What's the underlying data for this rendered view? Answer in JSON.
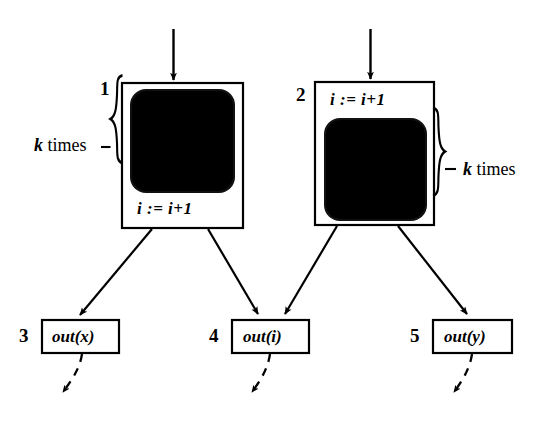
{
  "figure": {
    "type": "control-flow-diagram",
    "background": "#ffffff",
    "stroke": "#000000"
  },
  "loop_nodes": [
    {
      "id": "node-1",
      "number": "1",
      "assignment": "i := i+1",
      "assignment_position": "bottom",
      "annotation": "k times",
      "annotation_side": "left",
      "blob": "filled-black-rounded-square"
    },
    {
      "id": "node-2",
      "number": "2",
      "assignment": "i := i+1",
      "assignment_position": "top",
      "annotation": "k times",
      "annotation_side": "right",
      "blob": "filled-black-rounded-square"
    }
  ],
  "output_nodes": [
    {
      "id": "node-3",
      "number": "3",
      "label": "out(x)"
    },
    {
      "id": "node-4",
      "number": "4",
      "label": "out(i)"
    },
    {
      "id": "node-5",
      "number": "5",
      "label": "out(y)"
    }
  ],
  "annotations": {
    "k_times_left": "k times",
    "k_times_right": "k times",
    "k_symbol": "k",
    "times_word": " times"
  },
  "edges": [
    {
      "from": "entry",
      "to": "node-1",
      "style": "solid-arrow"
    },
    {
      "from": "entry",
      "to": "node-2",
      "style": "solid-arrow"
    },
    {
      "from": "node-1",
      "to": "node-3",
      "style": "solid-arrow"
    },
    {
      "from": "node-1",
      "to": "node-4",
      "style": "solid-arrow"
    },
    {
      "from": "node-2",
      "to": "node-4",
      "style": "solid-arrow"
    },
    {
      "from": "node-2",
      "to": "node-5",
      "style": "solid-arrow"
    },
    {
      "from": "node-3",
      "to": "continuation",
      "style": "dashed-arrow"
    },
    {
      "from": "node-4",
      "to": "continuation",
      "style": "dashed-arrow"
    },
    {
      "from": "node-5",
      "to": "continuation",
      "style": "dashed-arrow"
    }
  ]
}
